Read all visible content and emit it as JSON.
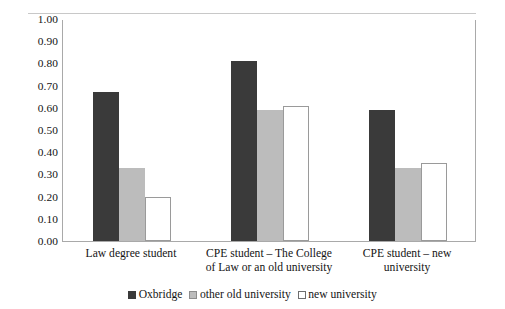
{
  "chart_data": {
    "type": "bar",
    "title": "",
    "subtitle": "",
    "xlabel": "",
    "ylabel": "",
    "ylim": [
      0.0,
      1.0
    ],
    "ytick_step": 0.1,
    "ytick_labels": [
      "1.00",
      "0.90",
      "0.80",
      "0.70",
      "0.60",
      "0.50",
      "0.40",
      "0.30",
      "0.20",
      "0.10",
      "0.00"
    ],
    "ytick_values": [
      1.0,
      0.9,
      0.8,
      0.7,
      0.6,
      0.5,
      0.4,
      0.3,
      0.2,
      0.1,
      0.0
    ],
    "grid": false,
    "legend_position": "bottom",
    "categories": [
      "Law degree student",
      "CPE student – The College of Law or an old university",
      "CPE student – new university"
    ],
    "category_lines": [
      [
        "Law degree student"
      ],
      [
        "CPE student – The College",
        "of Law or an old university"
      ],
      [
        "CPE student – new",
        "university"
      ]
    ],
    "series": [
      {
        "name": "Oxbridge",
        "color": "#3a3a3a",
        "values": [
          0.67,
          0.81,
          0.59
        ]
      },
      {
        "name": "other old university",
        "color": "#bcbcbc",
        "values": [
          0.33,
          0.59,
          0.33
        ]
      },
      {
        "name": "new university",
        "color": "#ffffff",
        "values": [
          0.2,
          0.61,
          0.35
        ]
      }
    ]
  },
  "legend": {
    "entries": [
      {
        "label": "Oxbridge",
        "swatch": "dark-filled-square"
      },
      {
        "label": "other old university",
        "swatch": "grey-filled-square"
      },
      {
        "label": "new university",
        "swatch": "white-outline-square"
      }
    ]
  }
}
